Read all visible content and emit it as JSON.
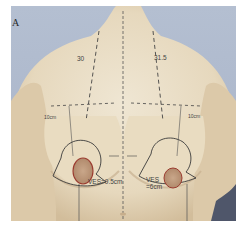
{
  "figure": {
    "panel_label": "A",
    "colors": {
      "background": "#b9c3d4",
      "skin": "#e8dcc4",
      "skin_shadow": "#c9b596",
      "marker_dark": "#3a3a3a",
      "marker_red": "#9b3b2f"
    },
    "annotations": {
      "left_sn_n": "30",
      "right_sn_n": "31.5",
      "left_lateral": "10cm",
      "right_lateral": "10cm",
      "left_ves": "VES=9.5cm",
      "right_ves_line1": "VES",
      "right_ves_line2": "=6cm"
    }
  }
}
